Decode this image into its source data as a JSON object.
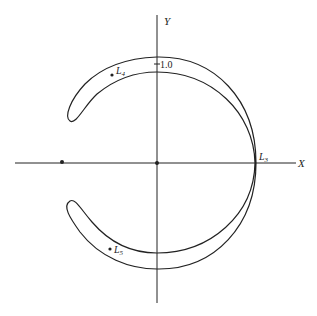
{
  "diagram": {
    "axes": {
      "x_label": "X",
      "y_label": "Y",
      "y_tick_label": "1.0"
    },
    "points": [
      {
        "name": "L3",
        "label_main": "L",
        "label_sub": "3"
      },
      {
        "name": "L4",
        "label_main": "L",
        "label_sub": "4"
      },
      {
        "name": "L5",
        "label_main": "L",
        "label_sub": "5"
      }
    ],
    "colors": {
      "line": "#222222",
      "background": "#ffffff"
    }
  }
}
